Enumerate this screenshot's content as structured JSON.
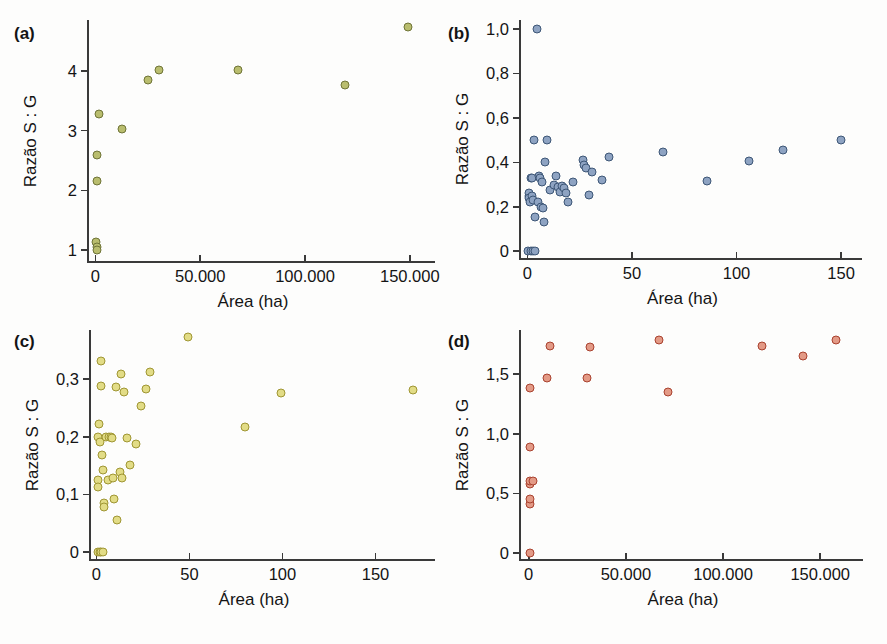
{
  "figure": {
    "width": 887,
    "height": 644,
    "background": "#fdfdfc",
    "axis_color": "#3a3a3a"
  },
  "chart_data": [
    {
      "id": "a",
      "type": "scatter",
      "tag": "(a)",
      "title": "",
      "xlabel": "Área (ha)",
      "ylabel": "Razão S : G",
      "marker_color": "#b9bd6e",
      "marker_edge": "#6f7437",
      "xticks": [
        0,
        50000,
        100000,
        150000
      ],
      "xtick_labels": [
        "0",
        "50.000",
        "100.000",
        "150.000"
      ],
      "yticks": [
        1,
        2,
        3,
        4
      ],
      "ytick_labels": [
        "1",
        "2",
        "3",
        "4"
      ],
      "xlim": [
        -4000,
        162000
      ],
      "ylim": [
        0.82,
        4.85
      ],
      "grid": false,
      "legend": "none",
      "points": [
        {
          "x": 400,
          "y": 1.14
        },
        {
          "x": 600,
          "y": 1.06
        },
        {
          "x": 900,
          "y": 1.0
        },
        {
          "x": 700,
          "y": 2.16
        },
        {
          "x": 900,
          "y": 2.6
        },
        {
          "x": 1500,
          "y": 3.28
        },
        {
          "x": 12500,
          "y": 3.03
        },
        {
          "x": 25000,
          "y": 3.85
        },
        {
          "x": 30500,
          "y": 4.02
        },
        {
          "x": 68000,
          "y": 4.02
        },
        {
          "x": 119000,
          "y": 3.77
        },
        {
          "x": 149000,
          "y": 4.74
        }
      ]
    },
    {
      "id": "b",
      "type": "scatter",
      "tag": "(b)",
      "title": "",
      "xlabel": "Área (ha)",
      "ylabel": "Razão S : G",
      "marker_color": "#8ea3c2",
      "marker_edge": "#3d5676",
      "xticks": [
        0,
        50,
        100,
        150
      ],
      "xtick_labels": [
        "0",
        "50",
        "100",
        "150"
      ],
      "yticks": [
        0,
        0.2,
        0.4,
        0.6,
        0.8,
        1.0
      ],
      "ytick_labels": [
        "0",
        "0,2",
        "0,4",
        "0,6",
        "0,8",
        "1,0"
      ],
      "xlim": [
        -4,
        160
      ],
      "ylim": [
        -0.03,
        1.04
      ],
      "grid": false,
      "legend": "none",
      "points": [
        {
          "x": 0.5,
          "y": 0.0
        },
        {
          "x": 1.5,
          "y": 0.0
        },
        {
          "x": 2.5,
          "y": 0.0
        },
        {
          "x": 3.5,
          "y": 0.0
        },
        {
          "x": 0.6,
          "y": 0.25
        },
        {
          "x": 0.8,
          "y": 0.26
        },
        {
          "x": 1.0,
          "y": 0.24
        },
        {
          "x": 1.2,
          "y": 0.22
        },
        {
          "x": 1.6,
          "y": 0.33
        },
        {
          "x": 2.0,
          "y": 0.33
        },
        {
          "x": 2.2,
          "y": 0.25
        },
        {
          "x": 2.6,
          "y": 0.23
        },
        {
          "x": 3.0,
          "y": 0.5
        },
        {
          "x": 3.6,
          "y": 0.155
        },
        {
          "x": 4.4,
          "y": 1.0
        },
        {
          "x": 5.0,
          "y": 0.22
        },
        {
          "x": 5.5,
          "y": 0.34
        },
        {
          "x": 6.0,
          "y": 0.33
        },
        {
          "x": 6.4,
          "y": 0.2
        },
        {
          "x": 7.0,
          "y": 0.31
        },
        {
          "x": 7.4,
          "y": 0.195
        },
        {
          "x": 8.0,
          "y": 0.13
        },
        {
          "x": 8.6,
          "y": 0.4
        },
        {
          "x": 9.6,
          "y": 0.5
        },
        {
          "x": 11.0,
          "y": 0.275
        },
        {
          "x": 12.5,
          "y": 0.3
        },
        {
          "x": 13.5,
          "y": 0.34
        },
        {
          "x": 14.5,
          "y": 0.29
        },
        {
          "x": 15.5,
          "y": 0.265
        },
        {
          "x": 16.5,
          "y": 0.295
        },
        {
          "x": 17.5,
          "y": 0.285
        },
        {
          "x": 18.5,
          "y": 0.26
        },
        {
          "x": 19.5,
          "y": 0.22
        },
        {
          "x": 22.0,
          "y": 0.31
        },
        {
          "x": 26.5,
          "y": 0.41
        },
        {
          "x": 27.0,
          "y": 0.39
        },
        {
          "x": 28.0,
          "y": 0.375
        },
        {
          "x": 29.5,
          "y": 0.255
        },
        {
          "x": 31.0,
          "y": 0.355
        },
        {
          "x": 35.5,
          "y": 0.32
        },
        {
          "x": 39.0,
          "y": 0.425
        },
        {
          "x": 65.0,
          "y": 0.445
        },
        {
          "x": 86.0,
          "y": 0.315
        },
        {
          "x": 106.0,
          "y": 0.405
        },
        {
          "x": 122.0,
          "y": 0.455
        },
        {
          "x": 150.0,
          "y": 0.5
        }
      ]
    },
    {
      "id": "c",
      "type": "scatter",
      "tag": "(c)",
      "title": "",
      "xlabel": "Área (ha)",
      "ylabel": "Razão S : G",
      "marker_color": "#e2dc86",
      "marker_edge": "#9f9633",
      "xticks": [
        0,
        50,
        100,
        150
      ],
      "xtick_labels": [
        "0",
        "50",
        "100",
        "150"
      ],
      "yticks": [
        0,
        0.1,
        0.2,
        0.3
      ],
      "ytick_labels": [
        "0",
        "0,1",
        "0,2",
        "0,3"
      ],
      "xlim": [
        -4,
        182
      ],
      "ylim": [
        -0.012,
        0.385
      ],
      "grid": false,
      "legend": "none",
      "points": [
        {
          "x": 0.8,
          "y": 0.0
        },
        {
          "x": 1.8,
          "y": 0.0
        },
        {
          "x": 2.6,
          "y": 0.0
        },
        {
          "x": 3.6,
          "y": 0.0
        },
        {
          "x": 0.6,
          "y": 0.2
        },
        {
          "x": 0.8,
          "y": 0.125
        },
        {
          "x": 1.0,
          "y": 0.113
        },
        {
          "x": 1.4,
          "y": 0.222
        },
        {
          "x": 1.8,
          "y": 0.19
        },
        {
          "x": 2.2,
          "y": 0.288
        },
        {
          "x": 2.6,
          "y": 0.332
        },
        {
          "x": 3.0,
          "y": 0.168
        },
        {
          "x": 3.4,
          "y": 0.143
        },
        {
          "x": 3.8,
          "y": 0.085
        },
        {
          "x": 4.0,
          "y": 0.079
        },
        {
          "x": 5.0,
          "y": 0.199
        },
        {
          "x": 6.0,
          "y": 0.125
        },
        {
          "x": 6.6,
          "y": 0.199
        },
        {
          "x": 7.6,
          "y": 0.199
        },
        {
          "x": 8.6,
          "y": 0.198
        },
        {
          "x": 9.0,
          "y": 0.128
        },
        {
          "x": 9.6,
          "y": 0.092
        },
        {
          "x": 10.5,
          "y": 0.286
        },
        {
          "x": 11.0,
          "y": 0.056
        },
        {
          "x": 12.5,
          "y": 0.138
        },
        {
          "x": 13.0,
          "y": 0.308
        },
        {
          "x": 14.0,
          "y": 0.128
        },
        {
          "x": 15.0,
          "y": 0.277
        },
        {
          "x": 16.5,
          "y": 0.198
        },
        {
          "x": 18.0,
          "y": 0.151
        },
        {
          "x": 21.0,
          "y": 0.188
        },
        {
          "x": 24.0,
          "y": 0.254
        },
        {
          "x": 26.5,
          "y": 0.282
        },
        {
          "x": 29.0,
          "y": 0.313
        },
        {
          "x": 49.0,
          "y": 0.372
        },
        {
          "x": 80.0,
          "y": 0.216
        },
        {
          "x": 99.0,
          "y": 0.276
        },
        {
          "x": 170.0,
          "y": 0.281
        }
      ]
    },
    {
      "id": "d",
      "type": "scatter",
      "tag": "(d)",
      "title": "",
      "xlabel": "Área (ha)",
      "ylabel": "Razão S : G",
      "marker_color": "#e39a86",
      "marker_edge": "#a9422f",
      "xticks": [
        0,
        50000,
        100000,
        150000
      ],
      "xtick_labels": [
        "0",
        "50.000",
        "100.000",
        "150.000"
      ],
      "yticks": [
        0,
        0.5,
        1.0,
        1.5
      ],
      "ytick_labels": [
        "0",
        "0,5",
        "1,0",
        "1,5"
      ],
      "xlim": [
        -5000,
        172000
      ],
      "ylim": [
        -0.05,
        1.87
      ],
      "grid": false,
      "legend": "none",
      "points": [
        {
          "x": 600,
          "y": 0.0
        },
        {
          "x": 500,
          "y": 0.41
        },
        {
          "x": 600,
          "y": 0.45
        },
        {
          "x": 600,
          "y": 0.58
        },
        {
          "x": 800,
          "y": 0.6
        },
        {
          "x": 2200,
          "y": 0.6
        },
        {
          "x": 700,
          "y": 0.89
        },
        {
          "x": 900,
          "y": 1.38
        },
        {
          "x": 9500,
          "y": 1.47
        },
        {
          "x": 11000,
          "y": 1.74
        },
        {
          "x": 30000,
          "y": 1.47
        },
        {
          "x": 31500,
          "y": 1.73
        },
        {
          "x": 67000,
          "y": 1.79
        },
        {
          "x": 71500,
          "y": 1.35
        },
        {
          "x": 120000,
          "y": 1.74
        },
        {
          "x": 141000,
          "y": 1.65
        },
        {
          "x": 158000,
          "y": 1.79
        }
      ]
    }
  ],
  "panel_geometry": [
    {
      "id": "a",
      "left": 10,
      "top": 14,
      "plot_x": 87,
      "plot_y": 20,
      "plot_w": 348,
      "plot_h": 241,
      "tag_x": 14,
      "tag_y": 24
    },
    {
      "id": "b",
      "left": 444,
      "top": 14,
      "plot_x": 519,
      "plot_y": 20,
      "plot_w": 343,
      "plot_h": 238,
      "tag_x": 448,
      "tag_y": 24
    },
    {
      "id": "c",
      "left": 10,
      "top": 324,
      "plot_x": 89,
      "plot_y": 330,
      "plot_w": 346,
      "plot_h": 229,
      "tag_x": 14,
      "tag_y": 332
    },
    {
      "id": "d",
      "left": 444,
      "top": 324,
      "plot_x": 519,
      "plot_y": 330,
      "plot_w": 344,
      "plot_h": 229,
      "tag_x": 448,
      "tag_y": 332
    }
  ]
}
